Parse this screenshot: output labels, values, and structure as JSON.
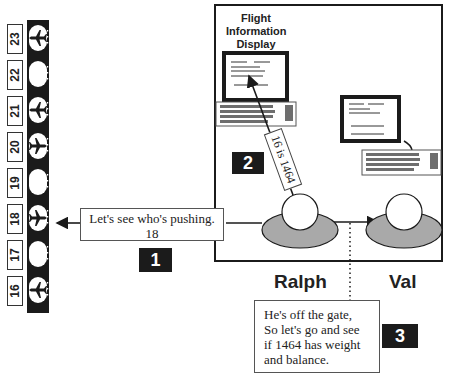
{
  "gates": [
    {
      "number": "23",
      "occupied": true
    },
    {
      "number": "22",
      "occupied": false
    },
    {
      "number": "21",
      "occupied": true
    },
    {
      "number": "20",
      "occupied": true
    },
    {
      "number": "19",
      "occupied": false
    },
    {
      "number": "18",
      "occupied": true
    },
    {
      "number": "17",
      "occupied": false
    },
    {
      "number": "16",
      "occupied": true
    }
  ],
  "display": {
    "title_line1": "Flight",
    "title_line2": "Information",
    "title_line3": "Display",
    "arrow_label": "16 is 1464"
  },
  "steps": [
    {
      "number": "1",
      "speech_line1": "Let's see who's pushing.",
      "speech_line2": "18"
    },
    {
      "number": "2"
    },
    {
      "number": "3",
      "speech_line1": "He's off the gate,",
      "speech_line2": "So let's go and see",
      "speech_line3": "if 1464 has weight",
      "speech_line4": "and balance."
    }
  ],
  "people": [
    {
      "name": "Ralph"
    },
    {
      "name": "Val"
    }
  ],
  "colors": {
    "strip": "#1b1b1b",
    "person_body": "#a9a9a9",
    "badge": "#1b1b1b",
    "frame": "#1b1b1b"
  }
}
